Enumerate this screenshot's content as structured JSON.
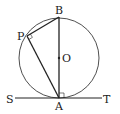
{
  "diagram": {
    "labels": {
      "B": "B",
      "P": "P",
      "O": "O",
      "S": "S",
      "A": "A",
      "T": "T"
    },
    "colors": {
      "stroke": "#222222",
      "background": "#ffffff"
    },
    "elements": {
      "circle": "circle with center O",
      "diameter": "AB",
      "chords": [
        "PB",
        "PA"
      ],
      "tangent_line": "ST tangent at A",
      "right_angles": [
        "angle APB",
        "angle at A between AB and ST"
      ]
    }
  }
}
